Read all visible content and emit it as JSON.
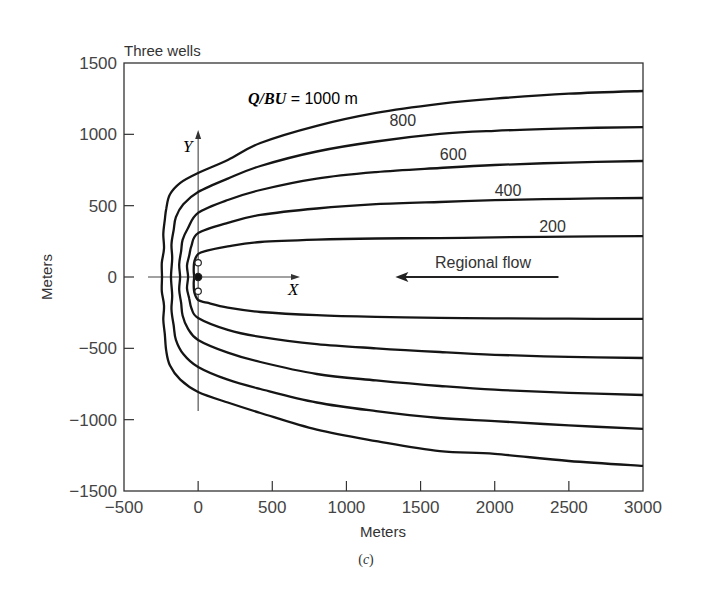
{
  "chart_data": {
    "type": "line",
    "title": "Three wells",
    "subtitle": "(c)",
    "xlabel": "Meters",
    "ylabel": "Meters",
    "xlim": [
      -500,
      3000
    ],
    "ylim": [
      -1500,
      1500
    ],
    "xticks": [
      -500,
      0,
      500,
      1000,
      1500,
      2000,
      2500,
      3000
    ],
    "yticks": [
      1500,
      1000,
      500,
      0,
      -500,
      -1000,
      -1500
    ],
    "xtick_labels": [
      "−500",
      "0",
      "500",
      "1000",
      "1500",
      "2000",
      "2500",
      "3000"
    ],
    "ytick_labels": [
      "1500",
      "1000",
      "500",
      "0",
      "−500",
      "−1000",
      "−1500"
    ],
    "grid": false,
    "legend": "inline labels",
    "parameter_label": {
      "prefix": "Q/BU",
      "text": " = 1000 m"
    },
    "inner_axes": {
      "x_label": "X",
      "y_label": "Y"
    },
    "annotation": {
      "text": "Regional flow",
      "arrow_from": [
        2430,
        0
      ],
      "arrow_to": [
        1330,
        0
      ]
    },
    "wells": [
      {
        "x": 0,
        "y": 0,
        "type": "filled"
      },
      {
        "x": 0,
        "y": 100,
        "type": "open"
      },
      {
        "x": 0,
        "y": -100,
        "type": "open"
      }
    ],
    "series": [
      {
        "name": "Q/BU = 1000 m",
        "label": "1000",
        "points": [
          [
            3000,
            -1324
          ],
          [
            2500,
            -1290
          ],
          [
            2000,
            -1240
          ],
          [
            1630,
            -1220
          ],
          [
            1200,
            -1150
          ],
          [
            800,
            -1070
          ],
          [
            420,
            -953
          ],
          [
            200,
            -880
          ],
          [
            0,
            -806
          ],
          [
            -120,
            -720
          ],
          [
            -190,
            -620
          ],
          [
            -215,
            -520
          ],
          [
            -225,
            -400
          ],
          [
            -235,
            -300
          ],
          [
            -230,
            -200
          ],
          [
            -245,
            -100
          ],
          [
            -244,
            0
          ],
          [
            -245,
            100
          ],
          [
            -230,
            200
          ],
          [
            -235,
            300
          ],
          [
            -225,
            400
          ],
          [
            -215,
            480
          ],
          [
            -190,
            580
          ],
          [
            -120,
            660
          ],
          [
            0,
            729
          ],
          [
            200,
            820
          ],
          [
            420,
            939
          ],
          [
            800,
            1060
          ],
          [
            1200,
            1150
          ],
          [
            1630,
            1213
          ],
          [
            2000,
            1250
          ],
          [
            2500,
            1285
          ],
          [
            3000,
            1304
          ]
        ]
      },
      {
        "name": "Q/BU = 800 m",
        "label": "800",
        "points": [
          [
            3000,
            -1065
          ],
          [
            2500,
            -1040
          ],
          [
            2000,
            -1010
          ],
          [
            1630,
            -988
          ],
          [
            1200,
            -940
          ],
          [
            800,
            -880
          ],
          [
            420,
            -785
          ],
          [
            200,
            -720
          ],
          [
            0,
            -631
          ],
          [
            -100,
            -540
          ],
          [
            -150,
            -440
          ],
          [
            -165,
            -340
          ],
          [
            -180,
            -230
          ],
          [
            -175,
            -130
          ],
          [
            -183,
            0
          ],
          [
            -175,
            130
          ],
          [
            -180,
            230
          ],
          [
            -165,
            330
          ],
          [
            -150,
            420
          ],
          [
            -100,
            510
          ],
          [
            0,
            596
          ],
          [
            200,
            690
          ],
          [
            420,
            778
          ],
          [
            800,
            880
          ],
          [
            1200,
            950
          ],
          [
            1630,
            1003
          ],
          [
            2000,
            1025
          ],
          [
            2500,
            1042
          ],
          [
            3000,
            1051
          ]
        ]
      },
      {
        "name": "Q/BU = 600 m",
        "label": "600",
        "points": [
          [
            3000,
            -827
          ],
          [
            2500,
            -812
          ],
          [
            2000,
            -790
          ],
          [
            1630,
            -764
          ],
          [
            1200,
            -725
          ],
          [
            800,
            -680
          ],
          [
            420,
            -596
          ],
          [
            200,
            -530
          ],
          [
            0,
            -441
          ],
          [
            -70,
            -360
          ],
          [
            -105,
            -270
          ],
          [
            -115,
            -180
          ],
          [
            -128,
            -90
          ],
          [
            -122,
            0
          ],
          [
            -128,
            90
          ],
          [
            -115,
            180
          ],
          [
            -105,
            260
          ],
          [
            -70,
            340
          ],
          [
            0,
            449
          ],
          [
            200,
            540
          ],
          [
            420,
            610
          ],
          [
            800,
            690
          ],
          [
            1200,
            735
          ],
          [
            1630,
            764
          ],
          [
            2000,
            785
          ],
          [
            2500,
            802
          ],
          [
            3000,
            813
          ]
        ]
      },
      {
        "name": "Q/BU = 400 m",
        "label": "400",
        "points": [
          [
            3000,
            -568
          ],
          [
            2500,
            -560
          ],
          [
            2000,
            -545
          ],
          [
            1630,
            -526
          ],
          [
            1200,
            -500
          ],
          [
            800,
            -470
          ],
          [
            420,
            -420
          ],
          [
            200,
            -370
          ],
          [
            0,
            -287
          ],
          [
            -45,
            -220
          ],
          [
            -60,
            -150
          ],
          [
            -75,
            -80
          ],
          [
            -68,
            0
          ],
          [
            -75,
            80
          ],
          [
            -60,
            150
          ],
          [
            -45,
            220
          ],
          [
            0,
            308
          ],
          [
            200,
            380
          ],
          [
            420,
            435
          ],
          [
            800,
            480
          ],
          [
            1200,
            510
          ],
          [
            1630,
            526
          ],
          [
            2000,
            538
          ],
          [
            2500,
            548
          ],
          [
            3000,
            554
          ]
        ]
      },
      {
        "name": "Q/BU = 200 m",
        "label": "200",
        "points": [
          [
            3000,
            -294
          ],
          [
            2500,
            -292
          ],
          [
            2000,
            -290
          ],
          [
            1630,
            -287
          ],
          [
            1200,
            -280
          ],
          [
            800,
            -268
          ],
          [
            420,
            -245
          ],
          [
            200,
            -215
          ],
          [
            60,
            -180
          ],
          [
            0,
            -161
          ],
          [
            -25,
            -110
          ],
          [
            -30,
            -50
          ],
          [
            -27,
            0
          ],
          [
            -30,
            50
          ],
          [
            -25,
            110
          ],
          [
            0,
            161
          ],
          [
            60,
            185
          ],
          [
            200,
            215
          ],
          [
            420,
            245
          ],
          [
            800,
            262
          ],
          [
            1200,
            270
          ],
          [
            1630,
            273
          ],
          [
            2000,
            278
          ],
          [
            2500,
            283
          ],
          [
            3000,
            287
          ]
        ]
      }
    ],
    "curve_labels": [
      {
        "text": "800",
        "x": 1380,
        "y": 1060
      },
      {
        "text": "600",
        "x": 1720,
        "y": 820
      },
      {
        "text": "400",
        "x": 2090,
        "y": 570
      },
      {
        "text": "200",
        "x": 2390,
        "y": 315
      }
    ]
  }
}
